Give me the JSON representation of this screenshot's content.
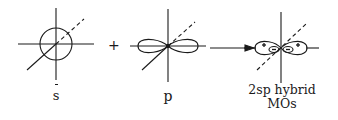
{
  "diagram": {
    "stroke_color": "#1a1a1a",
    "background": "#ffffff",
    "operators": {
      "plus": "+",
      "arrow": "arrow-right"
    },
    "s_orbital": {
      "label": "s",
      "shape": "sphere (circle)",
      "axes": [
        "x",
        "y",
        "z (dashed behind)"
      ]
    },
    "p_orbital": {
      "label": "p",
      "shape": "dumbbell (two lobes along horizontal axis)",
      "axes": [
        "x",
        "y",
        "z (dashed behind)"
      ]
    },
    "hybrid": {
      "label_line1": "2sp hybrid",
      "label_line2": "MOs",
      "large_lobe_sign": "+",
      "small_lobe_sign": "−",
      "lobes": [
        {
          "side": "left",
          "large_sign": "+",
          "small_sign": "−"
        },
        {
          "side": "right",
          "large_sign": "+",
          "small_sign": "−"
        }
      ]
    }
  }
}
